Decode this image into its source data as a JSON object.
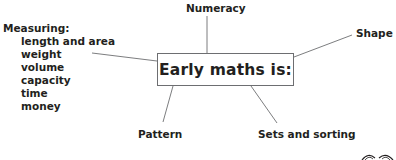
{
  "diagram": {
    "type": "mind-map",
    "center": {
      "label": "Early maths is:"
    },
    "branches": [
      {
        "label": "Measuring:",
        "items": [
          "length and area",
          "weight",
          "volume",
          "capacity",
          "time",
          "money"
        ]
      },
      {
        "label": "Numeracy"
      },
      {
        "label": "Shape"
      },
      {
        "label": "Pattern"
      },
      {
        "label": "Sets and sorting"
      }
    ],
    "decoration": {
      "icon": "glasses-icon"
    },
    "colors": {
      "text": "#231f20",
      "lines": "#6d6e71",
      "background": "#ffffff"
    }
  }
}
